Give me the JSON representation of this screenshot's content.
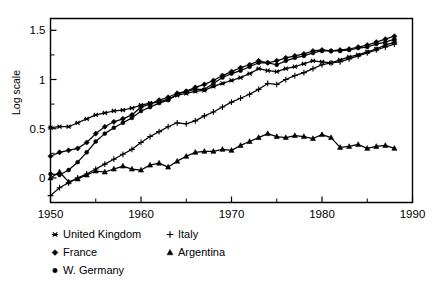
{
  "chart_data": {
    "type": "line",
    "title": "",
    "subtitle": "",
    "xlabel": "",
    "ylabel": "Log scale",
    "xlim": [
      1950,
      1990
    ],
    "ylim": [
      -0.25,
      1.62
    ],
    "grid": false,
    "legend_position": "below",
    "x_ticks_major": [
      1950,
      1960,
      1970,
      1980,
      1990
    ],
    "x_ticks_minor": [
      1955,
      1965,
      1975,
      1985
    ],
    "y_ticks_major": [
      0,
      0.5,
      1,
      1.5
    ],
    "y_ticks_minor": [
      0.25,
      0.75,
      1.25
    ],
    "x_tick_labels": [
      "1950",
      "1960",
      "1970",
      "1980",
      "1990"
    ],
    "y_tick_labels": [
      "0",
      "0.5",
      "1",
      "1.5"
    ],
    "x": [
      1950,
      1951,
      1952,
      1953,
      1954,
      1955,
      1956,
      1957,
      1958,
      1959,
      1960,
      1961,
      1962,
      1963,
      1964,
      1965,
      1966,
      1967,
      1968,
      1969,
      1970,
      1971,
      1972,
      1973,
      1974,
      1975,
      1976,
      1977,
      1978,
      1979,
      1980,
      1981,
      1982,
      1983,
      1984,
      1985,
      1986,
      1987,
      1988
    ],
    "series": [
      {
        "name": "United Kingdom",
        "marker": "star",
        "values": [
          0.51,
          0.52,
          0.52,
          0.56,
          0.6,
          0.64,
          0.66,
          0.68,
          0.69,
          0.71,
          0.74,
          0.76,
          0.77,
          0.8,
          0.84,
          0.86,
          0.88,
          0.89,
          0.93,
          0.96,
          0.99,
          1.02,
          1.06,
          1.11,
          1.09,
          1.08,
          1.11,
          1.13,
          1.16,
          1.19,
          1.18,
          1.17,
          1.2,
          1.23,
          1.25,
          1.28,
          1.31,
          1.35,
          1.38
        ]
      },
      {
        "name": "France",
        "marker": "diamond",
        "values": [
          0.22,
          0.26,
          0.28,
          0.3,
          0.36,
          0.45,
          0.52,
          0.57,
          0.6,
          0.64,
          0.72,
          0.75,
          0.79,
          0.82,
          0.86,
          0.88,
          0.92,
          0.95,
          0.99,
          1.04,
          1.08,
          1.12,
          1.15,
          1.19,
          1.17,
          1.19,
          1.22,
          1.24,
          1.26,
          1.29,
          1.3,
          1.29,
          1.3,
          1.31,
          1.33,
          1.35,
          1.38,
          1.41,
          1.44
        ]
      },
      {
        "name": "W. Germany",
        "marker": "circle",
        "values": [
          0.04,
          0.03,
          0.08,
          0.16,
          0.26,
          0.37,
          0.45,
          0.51,
          0.56,
          0.61,
          0.68,
          0.72,
          0.76,
          0.79,
          0.85,
          0.88,
          0.9,
          0.9,
          0.96,
          1.02,
          1.06,
          1.09,
          1.13,
          1.17,
          1.17,
          1.15,
          1.19,
          1.22,
          1.24,
          1.27,
          1.29,
          1.29,
          1.29,
          1.3,
          1.32,
          1.33,
          1.36,
          1.38,
          1.41
        ]
      },
      {
        "name": "Italy",
        "marker": "plus",
        "values": [
          -0.18,
          -0.1,
          -0.05,
          0.0,
          0.04,
          0.09,
          0.14,
          0.19,
          0.24,
          0.29,
          0.36,
          0.42,
          0.47,
          0.52,
          0.56,
          0.55,
          0.58,
          0.63,
          0.67,
          0.72,
          0.77,
          0.81,
          0.85,
          0.9,
          0.96,
          0.95,
          1.0,
          1.04,
          1.07,
          1.11,
          1.15,
          1.17,
          1.18,
          1.21,
          1.24,
          1.27,
          1.3,
          1.33,
          1.36
        ]
      },
      {
        "name": "Argentina",
        "marker": "triangle",
        "values": [
          0.0,
          0.06,
          -0.04,
          -0.01,
          0.03,
          0.07,
          0.06,
          0.09,
          0.12,
          0.09,
          0.08,
          0.13,
          0.15,
          0.11,
          0.17,
          0.22,
          0.26,
          0.27,
          0.27,
          0.29,
          0.28,
          0.33,
          0.37,
          0.41,
          0.45,
          0.42,
          0.41,
          0.43,
          0.42,
          0.4,
          0.44,
          0.41,
          0.31,
          0.32,
          0.34,
          0.3,
          0.32,
          0.33,
          0.3
        ]
      }
    ],
    "legend_entries": [
      {
        "label": "United Kingdom",
        "marker": "star"
      },
      {
        "label": "Italy",
        "marker": "plus"
      },
      {
        "label": "France",
        "marker": "diamond"
      },
      {
        "label": "Argentina",
        "marker": "triangle"
      },
      {
        "label": "W. Germany",
        "marker": "circle"
      }
    ]
  },
  "colors": {
    "ink": "#000000",
    "background": "#ffffff"
  }
}
